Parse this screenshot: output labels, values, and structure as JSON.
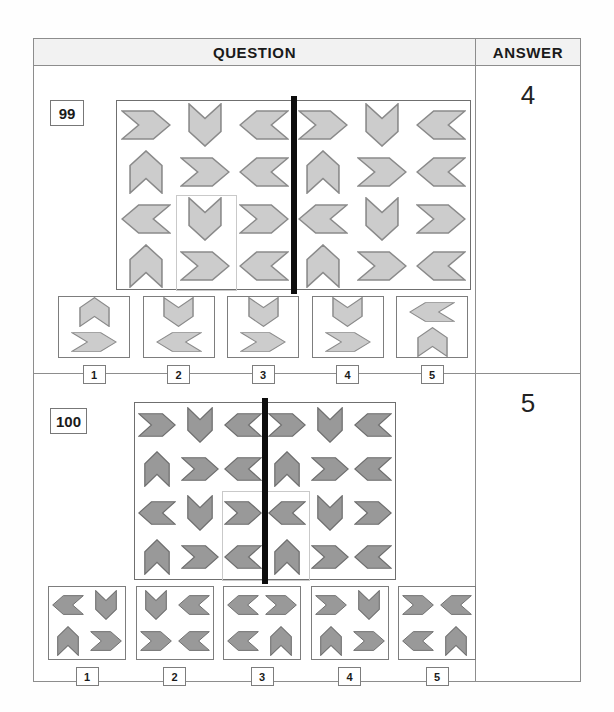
{
  "header": {
    "question_label": "QUESTION",
    "answer_label": "ANSWER"
  },
  "questions": [
    {
      "number": "99",
      "answer": "4",
      "fill": "#cccccc",
      "stroke": "#8a8a8a",
      "matrix": {
        "rows": 4,
        "cols": 6,
        "mirror_line": true,
        "highlight": {
          "row": 3,
          "col": 2,
          "rowspan": 2,
          "colspan": 1
        },
        "cells": [
          [
            "right",
            "down",
            "left",
            "right",
            "down",
            "left"
          ],
          [
            "up",
            "right",
            "left",
            "up",
            "right",
            "left"
          ],
          [
            "left",
            "down",
            "right",
            "left",
            "down",
            "right"
          ],
          [
            "up",
            "right",
            "left",
            "up",
            "right",
            "left"
          ]
        ]
      },
      "options": [
        {
          "num": "1",
          "layout": "2v",
          "shapes": [
            "up",
            "right"
          ]
        },
        {
          "num": "2",
          "layout": "2v",
          "shapes": [
            "down",
            "left"
          ]
        },
        {
          "num": "3",
          "layout": "2v",
          "shapes": [
            "down",
            "right"
          ]
        },
        {
          "num": "4",
          "layout": "2v",
          "shapes": [
            "down",
            "right"
          ]
        },
        {
          "num": "5",
          "layout": "2v",
          "shapes": [
            "left",
            "up"
          ]
        }
      ]
    },
    {
      "number": "100",
      "answer": "5",
      "fill": "#999999",
      "stroke": "#6e6e6e",
      "matrix": {
        "rows": 4,
        "cols": 6,
        "mirror_line": true,
        "highlight": {
          "row": 3,
          "col": 3,
          "rowspan": 2,
          "colspan": 2
        },
        "cells": [
          [
            "right",
            "down",
            "left",
            "right",
            "down",
            "left"
          ],
          [
            "up",
            "right",
            "left",
            "up",
            "right",
            "left"
          ],
          [
            "left",
            "down",
            "right",
            "left",
            "down",
            "right"
          ],
          [
            "up",
            "right",
            "left",
            "up",
            "right",
            "left"
          ]
        ]
      },
      "options": [
        {
          "num": "1",
          "layout": "2x2",
          "shapes": [
            "left",
            "down",
            "up",
            "right"
          ]
        },
        {
          "num": "2",
          "layout": "2x2",
          "shapes": [
            "down",
            "left",
            "right",
            "left"
          ]
        },
        {
          "num": "3",
          "layout": "2x2",
          "shapes": [
            "left",
            "right",
            "left",
            "up"
          ]
        },
        {
          "num": "4",
          "layout": "2x2",
          "shapes": [
            "right",
            "down",
            "up",
            "right"
          ]
        },
        {
          "num": "5",
          "layout": "2x2",
          "shapes": [
            "right",
            "left",
            "left",
            "up"
          ]
        }
      ]
    }
  ],
  "icons": {
    "arrow_right": "chevron-right-icon",
    "arrow_left": "chevron-left-icon",
    "arrow_up": "chevron-up-icon",
    "arrow_down": "chevron-down-icon"
  }
}
